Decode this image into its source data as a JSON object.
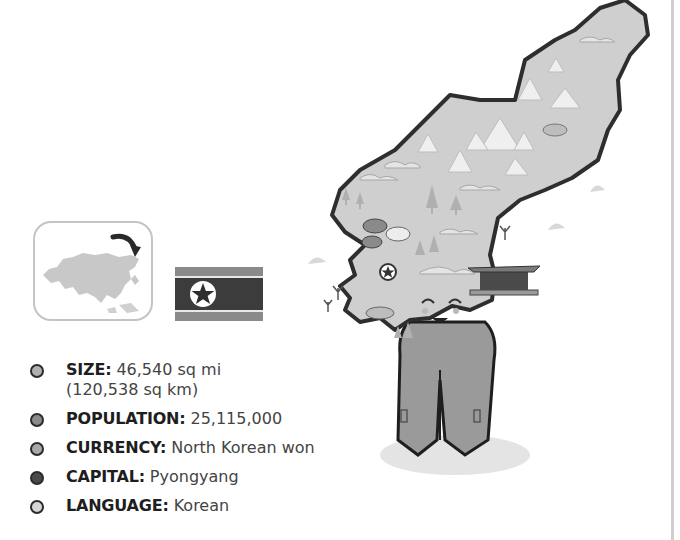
{
  "facts": [
    {
      "label": "SIZE:",
      "value": "46,540 sq mi",
      "value_line2": "(120,538 sq km)",
      "bullet_color": "#b0b0b0"
    },
    {
      "label": "POPULATION:",
      "value": "25,115,000",
      "bullet_color": "#8a8a8a"
    },
    {
      "label": "CURRENCY:",
      "value": "North Korean won",
      "bullet_color": "#a8a8a8"
    },
    {
      "label": "CAPITAL:",
      "value": "Pyongyang",
      "bullet_color": "#4a4a4a"
    },
    {
      "label": "LANGUAGE:",
      "value": "Korean",
      "bullet_color": "#d6d6d6"
    }
  ],
  "illustration": {
    "locator_map": "asia-locator-map",
    "flag": "north-korea-flag",
    "mascot": "north-korea-map-character"
  },
  "colors": {
    "map_fill": "#cfcfcf",
    "map_border": "#2e2e2e",
    "flag_band": "#7a7a7a",
    "flag_center": "#3c3c3c"
  }
}
